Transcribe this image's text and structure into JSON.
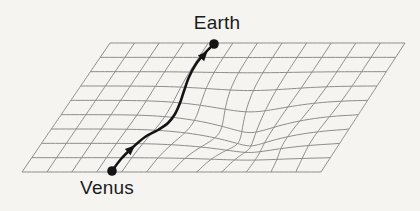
{
  "figure": {
    "background_color": "#f5f4f1",
    "grid_color": "#8d8d8d",
    "path_color": "#141414",
    "label_color": "#1b1b1b",
    "labels": {
      "earth": "Earth",
      "venus": "Venus"
    },
    "label_positions": {
      "earth": {
        "cx": 217,
        "top": 12
      },
      "venus": {
        "cx": 107,
        "top": 177
      }
    },
    "mesh": {
      "cols": 12,
      "rows": 9,
      "corners": {
        "tl": [
          110,
          43
        ],
        "tr": [
          405,
          43
        ],
        "bl": [
          22,
          172
        ],
        "br": [
          321,
          172
        ]
      },
      "stroke_width": 1
    },
    "gravity_well": {
      "cx": 252,
      "cy": 131,
      "sx": 62,
      "sy": 32,
      "pull_x": 0.6,
      "pull_y": 0.38,
      "sag": 18
    },
    "trajectory": {
      "points": [
        [
          112,
          171
        ],
        [
          121,
          159
        ],
        [
          132,
          148
        ],
        [
          145,
          137
        ],
        [
          158,
          130
        ],
        [
          168,
          123
        ],
        [
          175,
          114
        ],
        [
          180,
          103
        ],
        [
          184,
          91
        ],
        [
          189,
          77
        ],
        [
          196,
          64
        ],
        [
          205,
          53
        ],
        [
          213,
          45
        ]
      ],
      "stroke_width": 2.6,
      "dot_radius": 4.8,
      "venus_dot": [
        112,
        171
      ],
      "earth_dot": [
        214,
        44
      ],
      "arrowheads": [
        {
          "at": [
            131,
            149
          ],
          "angle": -42.5
        },
        {
          "at": [
            204,
            55
          ],
          "angle": -48.2
        }
      ]
    }
  }
}
